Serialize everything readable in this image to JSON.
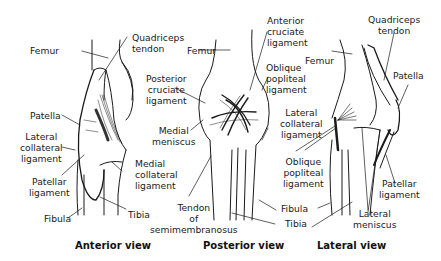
{
  "views": [
    {
      "caption": "Anterior view",
      "labels": {
        "femur": "Femur",
        "quadriceps_tendon": "Quadriceps\ntendon",
        "patella": "Patella",
        "lateral_collateral_ligament": "Lateral\ncollateral\nligament",
        "patellar_ligament": "Patellar\nligament",
        "fibula": "Fibula",
        "medial_collateral_ligament": "Medial\ncollateral\nligament",
        "tibia": "Tibia"
      }
    },
    {
      "caption": "Posterior view",
      "labels": {
        "femur": "Femur",
        "posterior_cruciate_ligament": "Posterior\ncruciate\nligament",
        "medial_meniscus": "Medial\nmeniscus",
        "tendon_of_semimembranosus": "Tendon\nof\nsemimembranosus",
        "anterior_cruciate_ligament": "Anterior\ncruciate\nligament",
        "oblique_popliteal_ligament": "Oblique\npopliteal\nligament",
        "lateral_collateral_ligament": "Lateral\ncollateral\nligament",
        "fibula": "Fibula",
        "tibia": "Tibia"
      }
    },
    {
      "caption": "Lateral view",
      "labels": {
        "femur": "Femur",
        "quadriceps_tendon": "Quadriceps\ntendon",
        "patella": "Patella",
        "oblique_popliteal_ligament": "Oblique\npopliteal\nligament",
        "patellar_ligament": "Patellar\nligament",
        "lateral_meniscus": "Lateral\nmeniscus"
      }
    }
  ],
  "colors": {
    "ink": "#1a1a1a",
    "background": "#ffffff"
  }
}
